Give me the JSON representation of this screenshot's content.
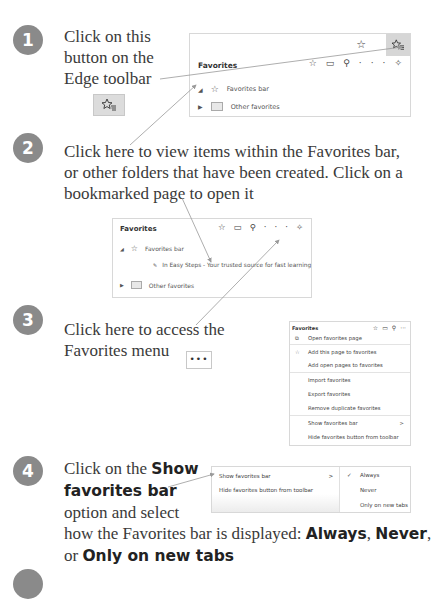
{
  "steps": [
    {
      "number": "1",
      "text_lines": [
        "Click on this",
        "button on the",
        "Edge toolbar"
      ]
    },
    {
      "number": "2",
      "text_lines": [
        "Click here to view items within the Favorites bar,",
        "or other folders that have been created. Click on a",
        "bookmarked page to open it"
      ]
    },
    {
      "number": "3",
      "text_lines": [
        "Click here to access the",
        "Favorites menu"
      ]
    },
    {
      "number": "4",
      "text_parts": {
        "line1_pre": "Click on the ",
        "line1_bold": "Show",
        "line2_bold": "favorites bar",
        "line3": "option and select",
        "line4_pre": "how the Favorites bar is displayed: ",
        "line4_bold1": "Always",
        "line4_sep": ", ",
        "line4_bold2": "Never",
        "line4_end": ",",
        "line5_pre": "or ",
        "line5_bold": "Only on new tabs"
      }
    },
    {
      "number": "5"
    }
  ],
  "icons": {
    "favorites_button": "star-with-lines-icon",
    "ellipsis_button": "•••"
  },
  "panel1": {
    "title": "Favorites",
    "items": [
      {
        "label": "Favorites bar",
        "expanded": true,
        "icon": "star-icon"
      },
      {
        "label": "Other favorites",
        "expanded": false,
        "icon": "folder-icon"
      }
    ]
  },
  "panel2": {
    "title": "Favorites",
    "items": [
      {
        "label": "Favorites bar",
        "expanded": true
      },
      {
        "label": "In Easy Steps - Your trusted source for fast learning"
      },
      {
        "label": "Other favorites",
        "expanded": false
      }
    ]
  },
  "panel3": {
    "title": "Favorites",
    "menu": [
      "Open favorites page",
      "Add this page to favorites",
      "Add open pages to favorites",
      "Import favorites",
      "Export favorites",
      "Remove duplicate favorites",
      "Show favorites bar",
      "Hide favorites button from toolbar"
    ],
    "submenu_chevron": ">"
  },
  "panel4": {
    "menu": [
      "Show favorites bar",
      "Hide favorites button from toolbar"
    ],
    "chevron": ">",
    "submenu": [
      "Always",
      "Never",
      "Only on new tabs"
    ],
    "checked": "Always",
    "checkmark": "✓"
  },
  "colors": {
    "step_circle": "#8a8a8a",
    "highlight_button": "#d6d6d6"
  }
}
